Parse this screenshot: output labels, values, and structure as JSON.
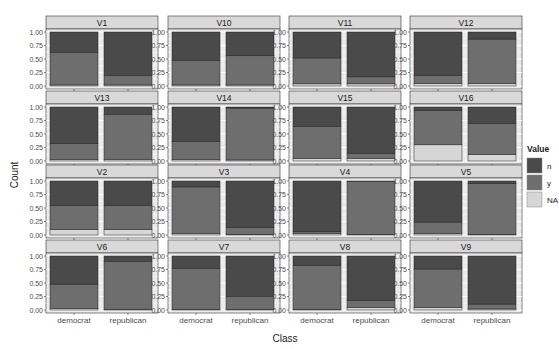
{
  "chart_data": {
    "type": "bar",
    "stacked": true,
    "position": "fill",
    "title": "",
    "xlabel": "Class",
    "ylabel": "Count",
    "ylim": [
      0,
      1
    ],
    "yticks": [
      "0.00",
      "0.25",
      "0.50",
      "0.75",
      "1.00"
    ],
    "categories": [
      "democrat",
      "republican"
    ],
    "grid": true,
    "legend": {
      "title": "Value",
      "placement": "right",
      "entries": [
        {
          "key": "n",
          "label": "n",
          "color": "#4a4a4a"
        },
        {
          "key": "y",
          "label": "y",
          "color": "#6e6e6e"
        },
        {
          "key": "NA",
          "label": "NA",
          "color": "#d6d6d6"
        }
      ]
    },
    "stack_order_bottom_to_top": [
      "NA",
      "y",
      "n"
    ],
    "facets": [
      {
        "label": "V1",
        "democrat": {
          "NA": 0.02,
          "y": 0.6,
          "n": 0.38
        },
        "republican": {
          "NA": 0.02,
          "y": 0.17,
          "n": 0.81
        }
      },
      {
        "label": "V10",
        "democrat": {
          "NA": 0.02,
          "y": 0.45,
          "n": 0.53
        },
        "republican": {
          "NA": 0.02,
          "y": 0.54,
          "n": 0.44
        }
      },
      {
        "label": "V11",
        "democrat": {
          "NA": 0.04,
          "y": 0.48,
          "n": 0.48
        },
        "republican": {
          "NA": 0.04,
          "y": 0.13,
          "n": 0.83
        }
      },
      {
        "label": "V12",
        "democrat": {
          "NA": 0.05,
          "y": 0.15,
          "n": 0.8
        },
        "republican": {
          "NA": 0.05,
          "y": 0.82,
          "n": 0.13
        }
      },
      {
        "label": "V13",
        "democrat": {
          "NA": 0.03,
          "y": 0.29,
          "n": 0.68
        },
        "republican": {
          "NA": 0.03,
          "y": 0.83,
          "n": 0.14
        }
      },
      {
        "label": "V14",
        "democrat": {
          "NA": 0.03,
          "y": 0.33,
          "n": 0.64
        },
        "republican": {
          "NA": 0.02,
          "y": 0.96,
          "n": 0.02
        }
      },
      {
        "label": "V15",
        "democrat": {
          "NA": 0.05,
          "y": 0.59,
          "n": 0.36
        },
        "republican": {
          "NA": 0.05,
          "y": 0.09,
          "n": 0.86
        }
      },
      {
        "label": "V16",
        "democrat": {
          "NA": 0.3,
          "y": 0.64,
          "n": 0.06
        },
        "republican": {
          "NA": 0.12,
          "y": 0.57,
          "n": 0.31
        }
      },
      {
        "label": "V2",
        "democrat": {
          "NA": 0.1,
          "y": 0.45,
          "n": 0.45
        },
        "republican": {
          "NA": 0.1,
          "y": 0.45,
          "n": 0.45
        }
      },
      {
        "label": "V3",
        "democrat": {
          "NA": 0.03,
          "y": 0.86,
          "n": 0.11
        },
        "republican": {
          "NA": 0.01,
          "y": 0.13,
          "n": 0.86
        }
      },
      {
        "label": "V4",
        "democrat": {
          "NA": 0.03,
          "y": 0.03,
          "n": 0.94
        },
        "republican": {
          "NA": 0.01,
          "y": 0.98,
          "n": 0.01
        }
      },
      {
        "label": "V5",
        "democrat": {
          "NA": 0.03,
          "y": 0.21,
          "n": 0.76
        },
        "republican": {
          "NA": 0.01,
          "y": 0.94,
          "n": 0.05
        }
      },
      {
        "label": "V6",
        "democrat": {
          "NA": 0.03,
          "y": 0.45,
          "n": 0.52
        },
        "republican": {
          "NA": 0.01,
          "y": 0.89,
          "n": 0.1
        }
      },
      {
        "label": "V7",
        "democrat": {
          "NA": 0.01,
          "y": 0.76,
          "n": 0.23
        },
        "republican": {
          "NA": 0.01,
          "y": 0.24,
          "n": 0.75
        }
      },
      {
        "label": "V8",
        "democrat": {
          "NA": 0.01,
          "y": 0.82,
          "n": 0.17
        },
        "republican": {
          "NA": 0.05,
          "y": 0.13,
          "n": 0.82
        }
      },
      {
        "label": "V9",
        "democrat": {
          "NA": 0.05,
          "y": 0.71,
          "n": 0.24
        },
        "republican": {
          "NA": 0.02,
          "y": 0.09,
          "n": 0.89
        }
      }
    ],
    "ncol": 4,
    "nrow": 4
  },
  "colors": {
    "panel_bg": "#ebebeb",
    "strip_bg": "#d9d9d9",
    "grid": "#ffffff",
    "border": "#333333"
  }
}
